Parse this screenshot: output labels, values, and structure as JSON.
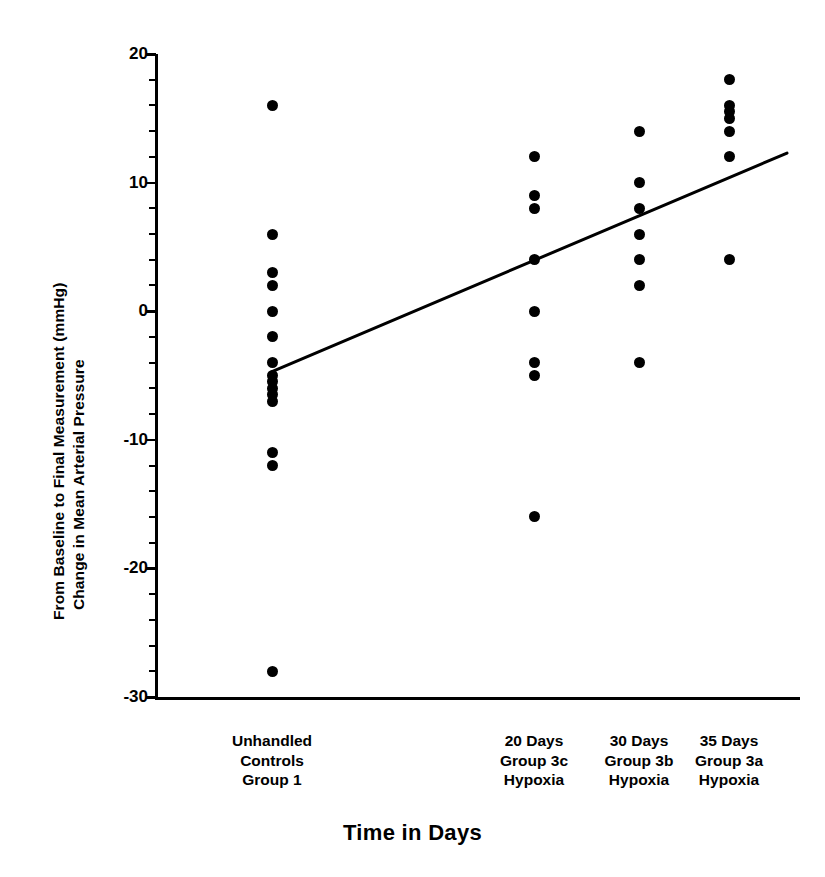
{
  "chart_data": {
    "type": "scatter",
    "title": "",
    "xlabel": "Time in Days",
    "ylabel": "Change in Mean Arterial Pressure\nFrom Baseline to Final Measurement (mmHg)",
    "ylabel_line1": "Change in Mean Arterial Pressure",
    "ylabel_line2": "From Baseline to Final Measurement (mmHg)",
    "ylim": [
      -30,
      20
    ],
    "yticks": [
      20,
      10,
      0,
      -10,
      -20,
      -30
    ],
    "ytick_labels": [
      "20",
      "10",
      "0",
      "-10",
      "-20",
      "-30"
    ],
    "yminor_step": 2,
    "grid": false,
    "legend": false,
    "xaxis_type": "categorical",
    "categories": [
      "Unhandled\nControls\nGroup 1",
      "20 Days\nGroup 3c\nHypoxia",
      "30 Days\nGroup 3b\nHypoxia",
      "35 Days\nGroup 3a\nHypoxia"
    ],
    "groups": [
      {
        "name": "Unhandled Controls Group 1",
        "label_line1": "Unhandled",
        "label_line2": "Controls",
        "label_line3": "Group 1",
        "x_days": 0,
        "x_pos_px": 272,
        "values": [
          16,
          6,
          3,
          2,
          0,
          -2,
          -4,
          -5,
          -5.5,
          -6,
          -6.5,
          -7,
          -11,
          -12,
          -28
        ]
      },
      {
        "name": "20 Days Group 3c Hypoxia",
        "label_line1": "20 Days",
        "label_line2": "Group 3c",
        "label_line3": "Hypoxia",
        "x_days": 20,
        "x_pos_px": 534,
        "values": [
          12,
          9,
          8,
          4,
          0,
          -4,
          -5,
          -16
        ]
      },
      {
        "name": "30 Days Group 3b Hypoxia",
        "label_line1": "30 Days",
        "label_line2": "Group 3b",
        "label_line3": "Hypoxia",
        "x_days": 30,
        "x_pos_px": 639,
        "values": [
          14,
          10,
          8,
          6,
          4,
          2,
          -4
        ]
      },
      {
        "name": "35 Days Group 3a Hypoxia",
        "label_line1": "35 Days",
        "label_line2": "Group 3a",
        "label_line3": "Hypoxia",
        "x_days": 35,
        "x_pos_px": 729,
        "values": [
          18,
          16,
          15.5,
          15,
          14,
          12,
          4
        ]
      }
    ],
    "trend_line": {
      "description": "linear regression line",
      "x_start_px": 272,
      "x_end_px": 787,
      "y_start_value": -4.7,
      "y_end_value": 12.3
    },
    "colors": {
      "marker": "#000000",
      "axis": "#000000",
      "trend": "#000000",
      "background": "#ffffff"
    }
  }
}
